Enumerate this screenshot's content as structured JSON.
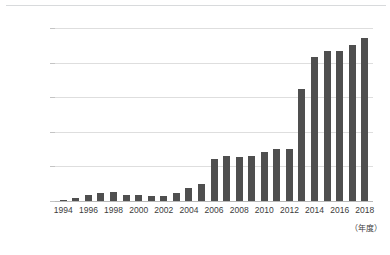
{
  "chart_data": {
    "type": "bar",
    "title": "",
    "subtitle": "",
    "xlabel": "（年度）",
    "ylabel": "",
    "unit": "兆日圓",
    "grid": true,
    "legend": false,
    "legend_position": "none",
    "bar_color": "#4f4f4f",
    "gridline_color": "#dedede",
    "axis_color": "#b9b9b9",
    "ylim": [
      0,
      10
    ],
    "ytick_values": [
      0,
      2,
      4,
      6,
      8,
      10
    ],
    "ytick_labels": [
      "0",
      "2兆日圓",
      "4兆日圓",
      "6兆日圓",
      "8兆日圓",
      "10兆日圓"
    ],
    "categories": [
      "1994",
      "1995",
      "1996",
      "1997",
      "1998",
      "1999",
      "2000",
      "2001",
      "2002",
      "2003",
      "2004",
      "2005",
      "2006",
      "2007",
      "2008",
      "2009",
      "2010",
      "2011",
      "2012",
      "2013",
      "2014",
      "2015",
      "2016",
      "2017",
      "2018"
    ],
    "xtick_labels": [
      "1994",
      "",
      "1996",
      "",
      "1998",
      "",
      "2000",
      "",
      "2002",
      "",
      "2004",
      "",
      "2006",
      "",
      "2008",
      "",
      "2010",
      "",
      "2012",
      "",
      "2014",
      "",
      "2016",
      "",
      "2018"
    ],
    "values": [
      0.08,
      0.18,
      0.35,
      0.48,
      0.5,
      0.33,
      0.32,
      0.31,
      0.3,
      0.45,
      0.78,
      1.0,
      2.42,
      2.63,
      2.52,
      2.62,
      2.82,
      3.0,
      3.0,
      6.5,
      8.3,
      8.7,
      8.7,
      9.0,
      9.4
    ]
  }
}
